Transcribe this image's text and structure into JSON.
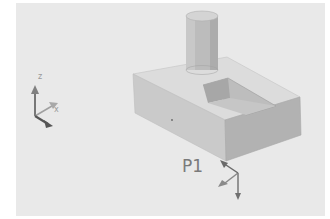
{
  "viewport": {
    "background": "#e9e9e9",
    "model": {
      "parts": [
        "base-block",
        "pocket",
        "cylinder-boss"
      ],
      "colors": {
        "top_face": "#dcdcdc",
        "front_face": "#c9c9c9",
        "side_face": "#b3b3b3",
        "pocket_inner": "#a9a9a9",
        "cylinder": "#bdbdbd"
      }
    },
    "point_label": "P1",
    "triad": {
      "z_label": "z",
      "x_label": "x"
    }
  }
}
